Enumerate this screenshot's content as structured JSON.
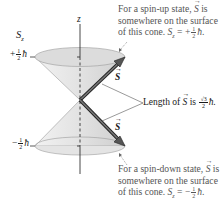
{
  "axis": {
    "z_label": "z",
    "sz_label": "S",
    "sz_subscript": "z",
    "plus_tick": {
      "sign": "+",
      "num": "1",
      "den": "2",
      "unit": "ħ"
    },
    "minus_tick": {
      "sign": "−",
      "num": "1",
      "den": "2",
      "unit": "ħ"
    }
  },
  "arrows": {
    "up_label": "S",
    "down_label": "S"
  },
  "captions": {
    "spin_up": {
      "line1_pre": "For a spin-up state, ",
      "line1_vec": "S",
      "line1_post": " is",
      "line2": "somewhere on the surface",
      "line3_pre": "of this cone. ",
      "line3_var": "S",
      "line3_sub": "z",
      "line3_eq": " = +",
      "line3_num": "1",
      "line3_den": "2",
      "line3_unit": "ħ."
    },
    "length": {
      "pre": "Length of ",
      "vec": "S",
      "mid": " is ",
      "num": "√3",
      "den": "2",
      "unit": "ħ."
    },
    "spin_down": {
      "line1_pre": "For a spin-down state, ",
      "line1_vec": "S",
      "line1_post": " is",
      "line2": "somewhere on the surface",
      "line3_pre": "of this cone. ",
      "line3_var": "S",
      "line3_sub": "z",
      "line3_eq": " = −",
      "line3_num": "1",
      "line3_den": "2",
      "line3_unit": "ħ."
    }
  },
  "colors": {
    "cone_fill": "#e6e6e6",
    "cone_top": "#d9d9d9",
    "arrow": "#4a4a4a",
    "caption_text": "#555555"
  }
}
